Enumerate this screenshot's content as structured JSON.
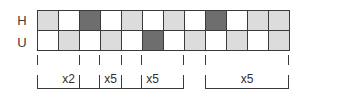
{
  "figure": {
    "type": "sequence-grid",
    "rows": [
      {
        "label": "H",
        "name": "row-h",
        "cells": [
          "light",
          "white",
          "dark",
          "white",
          "light",
          "white",
          "light",
          "white",
          "dark",
          "white",
          "light",
          "light"
        ]
      },
      {
        "label": "U",
        "name": "row-u",
        "cells": [
          "white",
          "light",
          "white",
          "light",
          "white",
          "dark",
          "white",
          "light",
          "white",
          "light",
          "white",
          "light"
        ]
      }
    ],
    "columns": 12,
    "shades": {
      "white": "#ffffff",
      "light": "#dcdcdc",
      "dark": "#6e6e6e",
      "border": "#3a3a3a"
    },
    "brackets": [
      {
        "label": "x2",
        "start_col": 0,
        "end_col": 2
      },
      {
        "label": "x5",
        "start_col": 2,
        "end_col": 4
      },
      {
        "label": "x5",
        "start_col": 4,
        "end_col": 6
      },
      {
        "label": "x5",
        "start_col": 8,
        "end_col": 11
      }
    ]
  }
}
